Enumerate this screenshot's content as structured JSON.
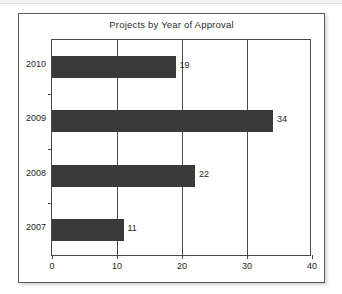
{
  "chart_data": {
    "type": "bar",
    "orientation": "horizontal",
    "title": "Projects by Year of Approval",
    "xlabel": "",
    "ylabel": "",
    "categories": [
      "2010",
      "2009",
      "2008",
      "2007"
    ],
    "values": [
      19,
      34,
      22,
      11
    ],
    "data_labels": [
      "19",
      "34",
      "22",
      "11"
    ],
    "xlim": [
      0,
      40
    ],
    "xticks": [
      0,
      10,
      20,
      30,
      40
    ],
    "xtick_labels": [
      "0",
      "10",
      "20",
      "30",
      "40"
    ],
    "gridlines": [
      10,
      20,
      30
    ],
    "grid": true,
    "legend": null,
    "bar_color": "#3a3a3a",
    "axis_color": "#4a4a4a",
    "text_color": "#1e1e1e",
    "background": "#ffffff"
  }
}
